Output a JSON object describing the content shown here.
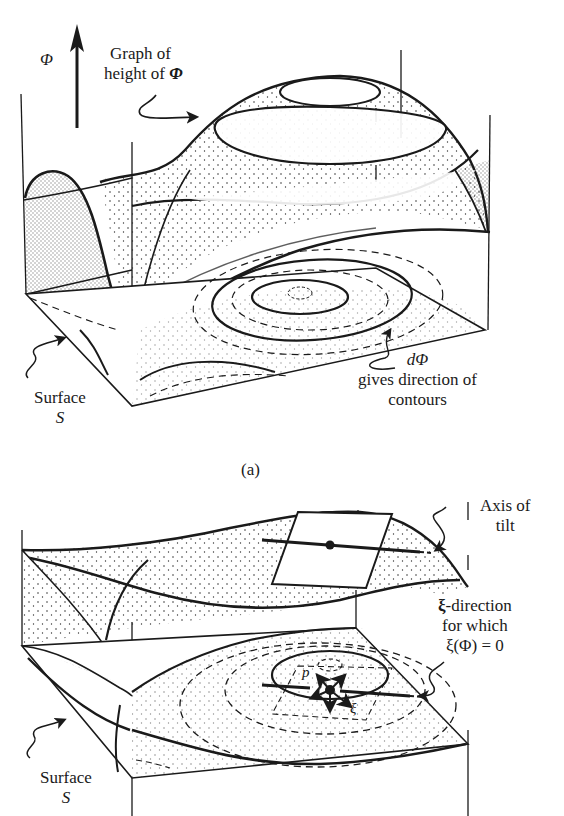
{
  "figure": {
    "panel_a": {
      "caption": "(a)",
      "axis_label": "Φ",
      "graph_label_line1": "Graph of",
      "graph_label_line2_prefix": "height of ",
      "graph_label_symbol": "Φ",
      "surface_label": "Surface",
      "surface_symbol": "S",
      "dphi_symbol": "dΦ",
      "dphi_line1": "gives direction of",
      "dphi_line2": "contours"
    },
    "panel_b": {
      "axis_label_line1": "Axis of",
      "axis_label_line2": "tilt",
      "xi_symbol": "ξ",
      "xi_line1_suffix": "-direction",
      "xi_line2": "for which",
      "xi_line3": "ξ(Φ) = 0",
      "point_label": "p",
      "vector_label": "ξ",
      "surface_label": "Surface",
      "surface_symbol": "S"
    },
    "colors": {
      "ink": "#1a1a1a",
      "paper": "#ffffff",
      "stipple": "#3a3a3a"
    }
  }
}
